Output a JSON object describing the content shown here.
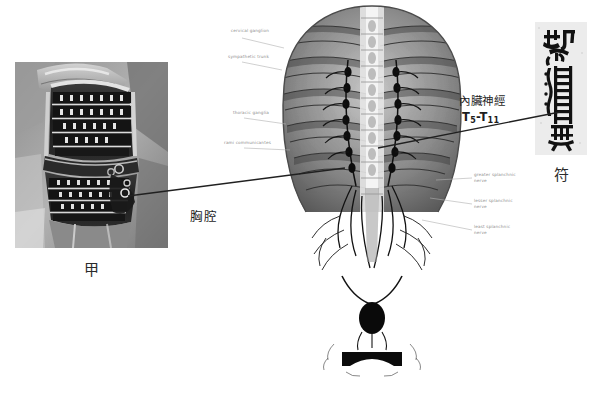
{
  "figure": {
    "background_color": "#ffffff",
    "width": 614,
    "height": 393
  },
  "panels": {
    "photo": {
      "caption": "甲",
      "description": "samurai lamellar cuirass photograph",
      "alt_note": "black-and-white photograph of armoured torso"
    },
    "anatomy": {
      "description": "posterior view of thoracic cage, vertebral column and sympathetic trunk with splanchnic nerves",
      "notes_left": [
        "cervical ganglion",
        "sympathetic trunk",
        "thoracic ganglia",
        "rami communicantes"
      ],
      "notes_right": [
        "greater splanchnic nerve",
        "lesser splanchnic nerve",
        "least splanchnic nerve"
      ]
    },
    "talisman": {
      "caption": "符",
      "description": "taoist talisman glyph printed in a grey rectangle"
    }
  },
  "callouts": {
    "thorax": "胸腔",
    "splanchnic_nerve": "內臟神經",
    "spinal_levels_prefix": "T",
    "spinal_level_start": "5",
    "spinal_levels_dash": "-T",
    "spinal_level_end": "11"
  },
  "colors": {
    "ink": "#1d1d1d",
    "leader_line": "#202020",
    "plate_note": "#8e8e8e",
    "talisman_bg": "#e9e9e9"
  }
}
